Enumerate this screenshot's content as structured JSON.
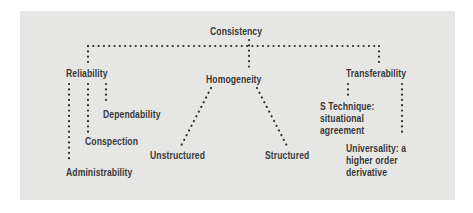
{
  "diagram": {
    "root": {
      "label": "Consistency"
    },
    "branches": [
      {
        "label": "Reliability",
        "children": [
          "Dependability",
          "Conspection",
          "Administrability"
        ]
      },
      {
        "label": "Homogeneity",
        "children": [
          "Unstructured",
          "Structured"
        ]
      },
      {
        "label": "Transferability",
        "children": [
          {
            "lines": [
              "S Technique:",
              "situational",
              "agreement"
            ]
          },
          {
            "lines": [
              "Universality: a",
              "higher order",
              "derivative"
            ]
          }
        ]
      }
    ],
    "colors": {
      "panel_background": "#e6e6e4",
      "page_background": "#ffffff",
      "text_and_dots": "#3a3a3a"
    },
    "connector_style": "dotted"
  }
}
